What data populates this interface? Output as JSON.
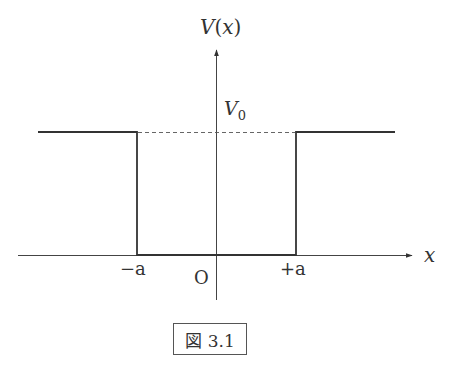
{
  "diagram": {
    "type": "finite square potential well",
    "y_axis_label": "V(x)",
    "x_axis_label": "x",
    "level_label": "V",
    "level_label_sub": "0",
    "origin_label": "O",
    "left_edge_label": "−a",
    "right_edge_label": "+a",
    "caption": "図 3.1",
    "colors": {
      "line": "#333333",
      "axis": "#444444",
      "dashed": "#555555"
    }
  }
}
